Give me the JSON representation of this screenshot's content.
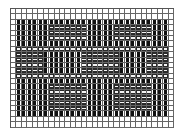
{
  "diagram": {
    "type": "weave-draft-grid",
    "columns": 30,
    "rows": 22,
    "pattern_area": {
      "col_start": 1,
      "col_end": 28,
      "row_start": 2,
      "row_end": 19
    },
    "dash_blocks": [
      {
        "col_start": 7,
        "col_end": 13,
        "row_start": 3,
        "row_end": 5
      },
      {
        "col_start": 19,
        "col_end": 25,
        "row_start": 3,
        "row_end": 5
      },
      {
        "col_start": 1,
        "col_end": 28,
        "row_start": 7,
        "row_end": 7
      },
      {
        "col_start": 1,
        "col_end": 5,
        "row_start": 8,
        "row_end": 12
      },
      {
        "col_start": 13,
        "col_end": 19,
        "row_start": 8,
        "row_end": 12
      },
      {
        "col_start": 25,
        "col_end": 28,
        "row_start": 8,
        "row_end": 12
      },
      {
        "col_start": 1,
        "col_end": 28,
        "row_start": 12,
        "row_end": 12
      },
      {
        "col_start": 7,
        "col_end": 13,
        "row_start": 14,
        "row_end": 18
      },
      {
        "col_start": 19,
        "col_end": 25,
        "row_start": 14,
        "row_end": 18
      }
    ],
    "colors": {
      "grid_line": "#666666",
      "warp": "#111111",
      "weft_mark": "#f4f4f4",
      "background": "#ffffff"
    }
  }
}
